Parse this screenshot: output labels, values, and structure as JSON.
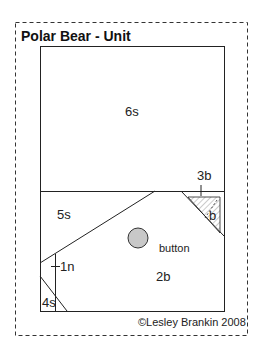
{
  "title": "Polar Bear - Unit",
  "copyright": "©Lesley Brankin 2008",
  "pieces": {
    "top": "6s",
    "left_mid": "5s",
    "corner_top_right": "3b",
    "hatched_small": "b",
    "center": "2b",
    "left_strip": "1n",
    "bottom_left": "4s",
    "button_label": "button"
  },
  "colors": {
    "line": "#222222",
    "dashed_border": "#333333",
    "button_fill": "#c8c8c8",
    "hatch": "#9a9a9a"
  }
}
